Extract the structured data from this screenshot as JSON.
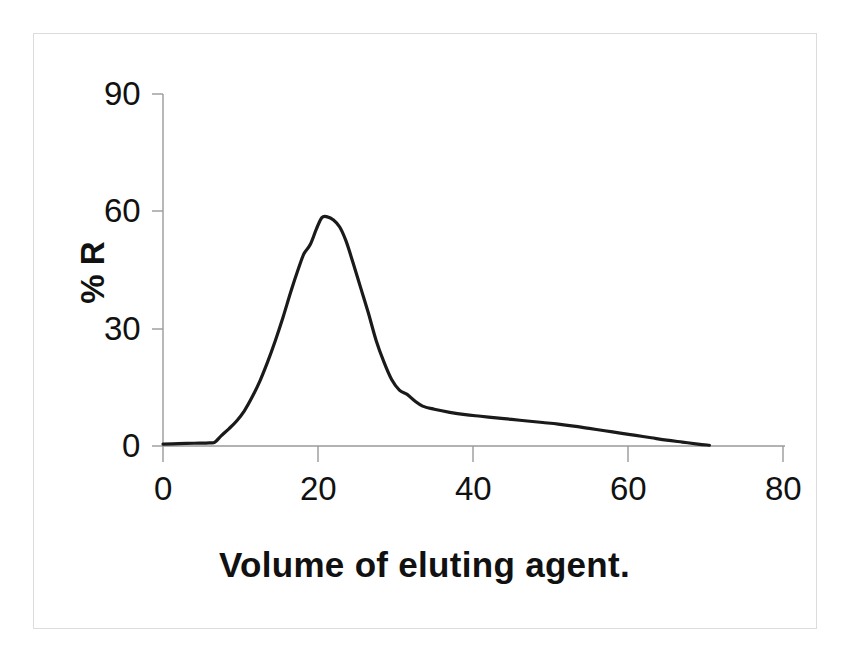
{
  "chart_data": {
    "type": "line",
    "title": "",
    "subtitle": "",
    "xlabel": "Volume of eluting agent.",
    "ylabel": "% R",
    "xlim": [
      0,
      80
    ],
    "ylim": [
      0,
      90
    ],
    "xticks": [
      0,
      20,
      40,
      60,
      80
    ],
    "yticks": [
      0,
      30,
      60,
      90
    ],
    "xtick_labels": [
      "0",
      "20",
      "40",
      "60",
      "80"
    ],
    "ytick_labels": [
      "0",
      "30",
      "60",
      "90"
    ],
    "grid": false,
    "legend": null,
    "legend_position": "none",
    "series": [
      {
        "name": "elution profile",
        "color": "#1a1a1a",
        "line_width": 3.2,
        "x": [
          0,
          2,
          4,
          6,
          6.7,
          7.5,
          8.5,
          9.5,
          10.5,
          11.5,
          12.5,
          13.5,
          14.5,
          15.5,
          16.5,
          17.5,
          18.2,
          19.0,
          19.8,
          20.5,
          21.2,
          22.0,
          22.8,
          23.6,
          24.5,
          25.5,
          26.5,
          27.5,
          28.5,
          29.5,
          30.5,
          31.5,
          32.5,
          33.5,
          35.0,
          37.0,
          39.0,
          41.0,
          43.0,
          45.0,
          47.0,
          49.0,
          51.0,
          53.0,
          55.0,
          57.0,
          59.0,
          61.0,
          63.0,
          65.0,
          67.0,
          69.0,
          70.5
        ],
        "y": [
          0.5,
          0.6,
          0.7,
          0.8,
          1.0,
          2.6,
          4.4,
          6.4,
          9.0,
          12.5,
          16.6,
          21.5,
          27.0,
          33.0,
          39.5,
          45.5,
          49.2,
          51.5,
          55.5,
          58.4,
          58.6,
          57.8,
          56.0,
          52.5,
          47.0,
          40.5,
          34.0,
          27.0,
          21.5,
          17.0,
          14.3,
          13.2,
          11.5,
          10.2,
          9.4,
          8.6,
          8.0,
          7.6,
          7.2,
          6.8,
          6.4,
          6.0,
          5.6,
          5.1,
          4.5,
          3.9,
          3.3,
          2.7,
          2.1,
          1.5,
          1.0,
          0.5,
          0.2
        ]
      }
    ],
    "annotations": [],
    "peak": {
      "x": 20.5,
      "y": 58.6
    }
  },
  "axes": {
    "y_axis_label": "% R",
    "x_axis_label": "Volume of eluting agent.",
    "x_tick_labels": [
      "0",
      "20",
      "40",
      "60",
      "80"
    ],
    "y_tick_labels": [
      "90",
      "60",
      "30",
      "0"
    ]
  },
  "colors": {
    "line": "#1a1a1a",
    "axis": "#8c8c8c",
    "text": "#111111",
    "frame": "#dcdcdc",
    "background": "#ffffff"
  }
}
